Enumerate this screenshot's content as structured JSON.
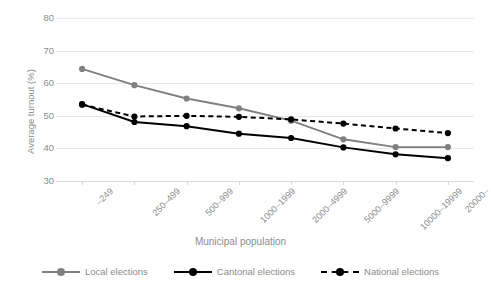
{
  "chart_data": {
    "type": "line",
    "title": "",
    "xlabel": "Municipal population",
    "ylabel": "Average turnout (%)",
    "ylim": [
      30,
      80
    ],
    "yticks": [
      30,
      40,
      50,
      60,
      70,
      80
    ],
    "grid": true,
    "legend_position": "bottom",
    "categories": [
      "–249",
      "250–499",
      "500–999",
      "1000–1999",
      "2000–4999",
      "5000–9999",
      "10000–19999",
      "20000–"
    ],
    "series": [
      {
        "name": "Local elections",
        "color": "#808080",
        "style": "solid",
        "values": [
          64.4,
          59.4,
          55.3,
          52.3,
          48.5,
          42.8,
          40.4,
          40.4
        ]
      },
      {
        "name": "Cantonal elections",
        "color": "#000000",
        "style": "solid",
        "values": [
          53.6,
          48.1,
          46.8,
          44.5,
          43.2,
          40.3,
          38.2,
          37.0
        ]
      },
      {
        "name": "National elections",
        "color": "#000000",
        "style": "dashed",
        "values": [
          53.4,
          49.8,
          50.0,
          49.7,
          48.9,
          47.6,
          46.1,
          44.7
        ]
      }
    ]
  },
  "axis": {
    "y_tick_labels": [
      "80",
      "70",
      "60",
      "50",
      "40",
      "30"
    ],
    "y_title": "Average turnout (%)",
    "x_title": "Municipal population",
    "x_tick_labels": [
      "–249",
      "250–499",
      "500–999",
      "1000–1999",
      "2000–4999",
      "5000–9999",
      "10000–19999",
      "20000–"
    ]
  },
  "legend": {
    "items": [
      {
        "label": "Local elections",
        "color": "#808080",
        "style": "solid"
      },
      {
        "label": "Cantonal elections",
        "color": "#000000",
        "style": "solid"
      },
      {
        "label": "National elections",
        "color": "#000000",
        "style": "dashed"
      }
    ]
  },
  "colors": {
    "grid": "#e8e8e8",
    "text": "#8c8c8c",
    "local": "#808080",
    "cantonal": "#000000",
    "national": "#000000",
    "background": "#ffffff"
  }
}
